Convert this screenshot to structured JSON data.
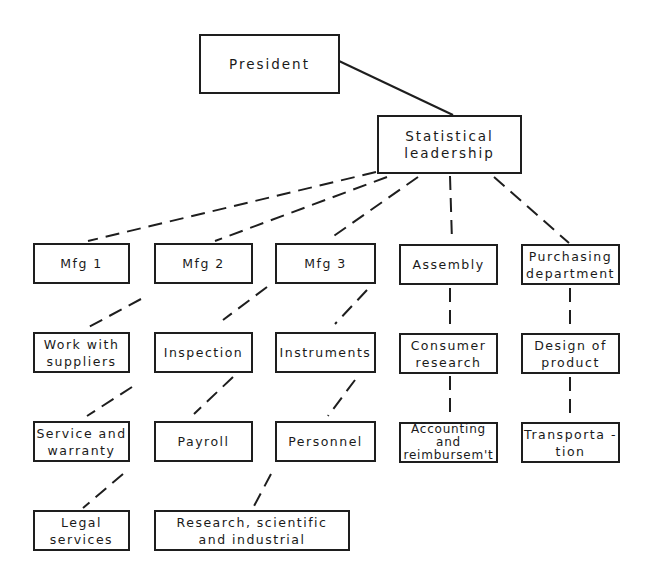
{
  "diagram": {
    "type": "organization-chart",
    "nodes": {
      "president": "President",
      "statistical_leadership": "Statistical\nleadership",
      "mfg1": "Mfg 1",
      "mfg2": "Mfg 2",
      "mfg3": "Mfg 3",
      "assembly": "Assembly",
      "purchasing": "Purchasing\ndepartment",
      "work_suppliers": "Work with\nsuppliers",
      "inspection": "Inspection",
      "instruments": "Instruments",
      "consumer_research": "Consumer\nresearch",
      "design_product": "Design of\nproduct",
      "service_warranty": "Service and\nwarranty",
      "payroll": "Payroll",
      "personnel": "Personnel",
      "accounting": "Accounting\nand\nreimbursem't",
      "transportation": "Transporta -\ntion",
      "legal": "Legal\nservices",
      "research": "Research, scientific\nand industrial"
    },
    "edges": [
      {
        "from": "president",
        "to": "statistical_leadership",
        "style": "solid"
      },
      {
        "from": "statistical_leadership",
        "to": "mfg1",
        "style": "dashed"
      },
      {
        "from": "statistical_leadership",
        "to": "mfg2",
        "style": "dashed"
      },
      {
        "from": "statistical_leadership",
        "to": "mfg3",
        "style": "dashed"
      },
      {
        "from": "statistical_leadership",
        "to": "assembly",
        "style": "dashed"
      },
      {
        "from": "statistical_leadership",
        "to": "purchasing",
        "style": "dashed"
      },
      {
        "from": "mfg1",
        "to": "work_suppliers",
        "style": "dashed"
      },
      {
        "from": "mfg2",
        "to": "inspection",
        "style": "dashed"
      },
      {
        "from": "mfg3",
        "to": "instruments",
        "style": "dashed"
      },
      {
        "from": "assembly",
        "to": "consumer_research",
        "style": "dashed"
      },
      {
        "from": "purchasing",
        "to": "design_product",
        "style": "dashed"
      },
      {
        "from": "work_suppliers",
        "to": "service_warranty",
        "style": "dashed"
      },
      {
        "from": "inspection",
        "to": "payroll",
        "style": "dashed"
      },
      {
        "from": "instruments",
        "to": "personnel",
        "style": "dashed"
      },
      {
        "from": "consumer_research",
        "to": "accounting",
        "style": "dashed"
      },
      {
        "from": "design_product",
        "to": "transportation",
        "style": "dashed"
      },
      {
        "from": "service_warranty",
        "to": "legal",
        "style": "dashed"
      },
      {
        "from": "personnel",
        "to": "research",
        "style": "dashed"
      }
    ]
  }
}
